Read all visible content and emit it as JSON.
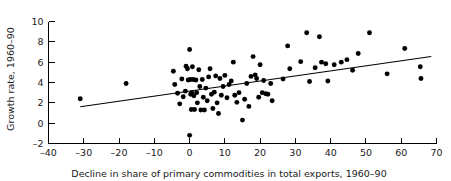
{
  "chart_data": {
    "type": "scatter",
    "title": "",
    "xlabel": "Decline in share of primary commodities in total exports, 1960–90",
    "ylabel": "Growth rate, 1960–90",
    "xlim": [
      -40,
      70
    ],
    "ylim": [
      -2,
      10
    ],
    "xticks": [
      -40,
      -30,
      -20,
      -10,
      0,
      10,
      20,
      30,
      40,
      50,
      60,
      70
    ],
    "yticks": [
      -2,
      0,
      2,
      4,
      6,
      8,
      10
    ],
    "xtick_labels": [
      "–40",
      "–30",
      "–20",
      "–10",
      "0",
      "10",
      "20",
      "30",
      "40",
      "50",
      "60",
      "70"
    ],
    "ytick_labels": [
      "–2",
      "0",
      "2",
      "4",
      "6",
      "8",
      "10"
    ],
    "grid": false,
    "legend": null,
    "marker_color": "#000000",
    "line_color": "#000000",
    "points": [
      [
        -31.0,
        2.4
      ],
      [
        -18.0,
        3.9
      ],
      [
        -4.6,
        5.1
      ],
      [
        -4.2,
        3.8
      ],
      [
        -3.4,
        2.95
      ],
      [
        -2.8,
        1.9
      ],
      [
        -2.2,
        4.35
      ],
      [
        -1.8,
        2.6
      ],
      [
        -1.2,
        3.15
      ],
      [
        -1.0,
        5.6
      ],
      [
        -0.6,
        5.35
      ],
      [
        -0.4,
        4.25
      ],
      [
        0.0,
        7.25
      ],
      [
        0.2,
        4.3
      ],
      [
        0.3,
        2.85
      ],
      [
        0.5,
        1.35
      ],
      [
        0.6,
        3.0
      ],
      [
        0.8,
        5.55
      ],
      [
        1.0,
        4.3
      ],
      [
        1.2,
        2.7
      ],
      [
        1.4,
        1.35
      ],
      [
        1.8,
        4.25
      ],
      [
        2.0,
        3.0
      ],
      [
        2.2,
        2.0
      ],
      [
        2.6,
        5.25
      ],
      [
        2.9,
        3.6
      ],
      [
        3.2,
        1.3
      ],
      [
        3.6,
        4.3
      ],
      [
        3.9,
        2.55
      ],
      [
        4.2,
        1.3
      ],
      [
        4.6,
        3.45
      ],
      [
        5.0,
        2.2
      ],
      [
        5.4,
        4.55
      ],
      [
        5.8,
        5.35
      ],
      [
        6.2,
        2.85
      ],
      [
        6.6,
        1.45
      ],
      [
        7.0,
        3.05
      ],
      [
        7.4,
        4.65
      ],
      [
        7.8,
        2.0
      ],
      [
        8.2,
        0.95
      ],
      [
        8.6,
        4.4
      ],
      [
        9.0,
        2.75
      ],
      [
        9.5,
        3.6
      ],
      [
        10.0,
        4.7
      ],
      [
        10.6,
        2.5
      ],
      [
        11.2,
        3.8
      ],
      [
        11.8,
        4.15
      ],
      [
        12.4,
        6.0
      ],
      [
        12.8,
        2.75
      ],
      [
        13.4,
        2.05
      ],
      [
        14.0,
        3.0
      ],
      [
        15.0,
        0.3
      ],
      [
        15.6,
        2.35
      ],
      [
        16.2,
        3.9
      ],
      [
        16.8,
        1.65
      ],
      [
        17.4,
        4.6
      ],
      [
        18.0,
        6.55
      ],
      [
        18.6,
        4.75
      ],
      [
        19.0,
        4.4
      ],
      [
        19.6,
        2.55
      ],
      [
        20.0,
        5.75
      ],
      [
        20.6,
        3.0
      ],
      [
        21.0,
        4.2
      ],
      [
        21.6,
        2.9
      ],
      [
        22.2,
        2.85
      ],
      [
        23.0,
        3.9
      ],
      [
        23.4,
        2.2
      ],
      [
        26.5,
        4.35
      ],
      [
        27.8,
        7.6
      ],
      [
        28.4,
        5.35
      ],
      [
        31.5,
        6.05
      ],
      [
        33.2,
        8.9
      ],
      [
        34.0,
        4.1
      ],
      [
        35.6,
        5.45
      ],
      [
        36.8,
        8.5
      ],
      [
        37.4,
        6.0
      ],
      [
        38.6,
        5.85
      ],
      [
        39.2,
        4.15
      ],
      [
        41.0,
        5.75
      ],
      [
        43.0,
        6.0
      ],
      [
        44.6,
        6.25
      ],
      [
        46.2,
        5.2
      ],
      [
        47.8,
        6.85
      ],
      [
        51.0,
        8.9
      ],
      [
        56.0,
        4.85
      ],
      [
        61.0,
        7.35
      ],
      [
        65.4,
        5.55
      ],
      [
        65.6,
        4.4
      ],
      [
        0.0,
        -1.2
      ]
    ],
    "fit_line": {
      "label": "least-squares trend line",
      "x_start": -31.0,
      "y_start": 1.62,
      "x_end": 68.5,
      "y_end": 6.55
    }
  }
}
